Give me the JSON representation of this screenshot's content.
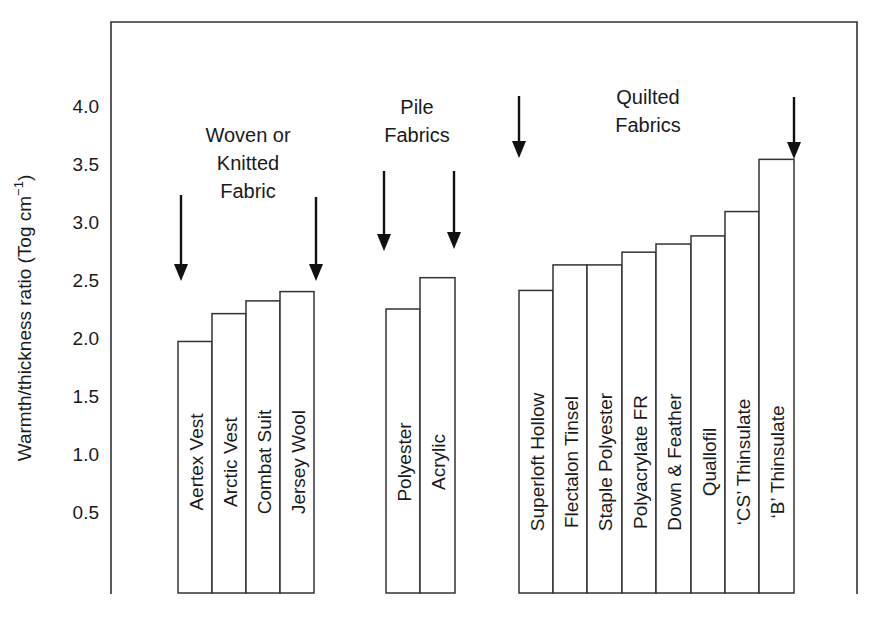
{
  "chart_data": {
    "type": "bar",
    "title": "",
    "xlabel": "",
    "ylabel": "Warmth/thickness ratio (Tog cm⁻¹)",
    "ylabel_main": "Warmth/thickness ratio (Tog cm",
    "ylabel_sup": "−1",
    "ylabel_close": ")",
    "ylim": [
      0,
      4.4
    ],
    "yticks": [
      0.5,
      1.0,
      1.5,
      2.0,
      2.5,
      3.0,
      3.5,
      4.0
    ],
    "ytick_labels": [
      "0.5",
      "1.0",
      "1.5",
      "2.0",
      "2.5",
      "3.0",
      "3.5",
      "4.0"
    ],
    "grid": false,
    "legend": "none",
    "groups": [
      {
        "name": "Woven or Knitted Fabric",
        "label_lines": [
          "Woven or",
          "Knitted",
          "Fabric"
        ],
        "categories": [
          "Aertex Vest",
          "Arctic Vest",
          "Combat Suit",
          "Jersey Wool"
        ],
        "values": [
          1.97,
          2.21,
          2.32,
          2.4
        ]
      },
      {
        "name": "Pile Fabrics",
        "label_lines": [
          "Pile",
          "Fabrics"
        ],
        "categories": [
          "Polyester",
          "Acrylic"
        ],
        "values": [
          2.25,
          2.52
        ]
      },
      {
        "name": "Quilted Fabrics",
        "label_lines": [
          "Quilted",
          "Fabrics"
        ],
        "categories": [
          "Superloft Hollow",
          "Flectalon Tinsel",
          "Staple Polyester",
          "Polyacrylate FR",
          "Down & Feather",
          "Quallofil",
          "‘CS’ Thinsulate",
          "‘B’ Thinsulate"
        ],
        "values": [
          2.41,
          2.63,
          2.63,
          2.74,
          2.81,
          2.88,
          3.09,
          3.54
        ]
      }
    ],
    "categories": [
      "Aertex Vest",
      "Arctic Vest",
      "Combat Suit",
      "Jersey Wool",
      "Polyester",
      "Acrylic",
      "Superloft Hollow",
      "Flectalon Tinsel",
      "Staple Polyester",
      "Polyacrylate FR",
      "Down & Feather",
      "Quallofil",
      "‘CS’ Thinsulate",
      "‘B’ Thinsulate"
    ],
    "values": [
      1.97,
      2.21,
      2.32,
      2.4,
      2.25,
      2.52,
      2.41,
      2.63,
      2.63,
      2.74,
      2.81,
      2.88,
      3.09,
      3.54
    ],
    "annotations": [
      {
        "text": "arrows bracket each fabric group (two per group, pointing down)"
      }
    ]
  },
  "layout": {
    "plot": {
      "left": 111,
      "top": 22,
      "right": 857,
      "bottom": 594
    },
    "y_zero_px": 570,
    "px_per_unit": 116,
    "bar_bottom_px": 593,
    "label_center_y": 462,
    "bar_groups_x": [
      [
        178,
        212,
        246,
        280,
        314
      ],
      [
        386,
        420,
        455
      ],
      [
        519,
        553,
        587,
        622,
        656,
        691,
        725,
        759,
        794
      ]
    ],
    "group_label_pos": [
      {
        "x": 248,
        "y": 142
      },
      {
        "x": 417,
        "y": 114
      },
      {
        "x": 648,
        "y": 104
      }
    ],
    "arrows": [
      {
        "x": 181,
        "y1": 195,
        "tip": 281
      },
      {
        "x": 316,
        "y1": 197,
        "tip": 281
      },
      {
        "x": 384,
        "y1": 171,
        "tip": 251
      },
      {
        "x": 454,
        "y1": 171,
        "tip": 249
      },
      {
        "x": 519,
        "y1": 96,
        "tip": 158
      },
      {
        "x": 794,
        "y1": 97,
        "tip": 159
      }
    ]
  }
}
